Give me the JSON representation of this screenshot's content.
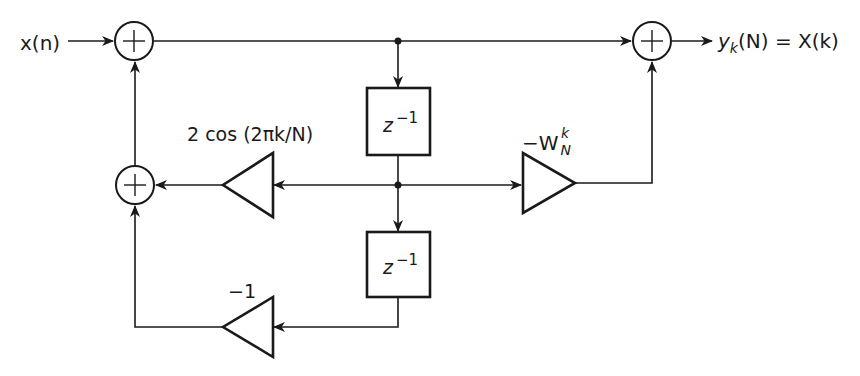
{
  "diagram": {
    "type": "signal-flow block diagram (Goertzel algorithm second-order section)",
    "input_label": "x(n)",
    "output_label": {
      "y": "y",
      "y_sub": "k",
      "rest": "(N) = X(k)"
    },
    "delay_blocks": [
      {
        "id": "delay-1",
        "label": "z",
        "sup": "−1"
      },
      {
        "id": "delay-2",
        "label": "z",
        "sup": "−1"
      }
    ],
    "gains": [
      {
        "id": "gain-cos",
        "label": "2 cos (2πk/N)"
      },
      {
        "id": "gain-minus-one",
        "label": "−1"
      },
      {
        "id": "gain-twiddle",
        "prefix": "−W",
        "sub": "N",
        "sup": "k"
      }
    ],
    "summers": [
      {
        "id": "sum-input",
        "symbol": "+"
      },
      {
        "id": "sum-feedback",
        "symbol": "+"
      },
      {
        "id": "sum-output",
        "symbol": "+"
      }
    ],
    "colors": {
      "ink": "#1a1a1a",
      "background": "#ffffff"
    }
  }
}
